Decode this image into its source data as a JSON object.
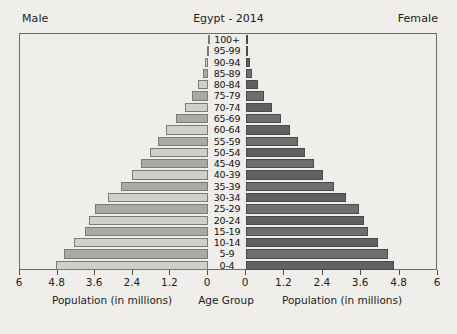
{
  "header": {
    "male_label": "Male",
    "female_label": "Female",
    "title": "Egypt - 2014"
  },
  "axis": {
    "left_title": "Population (in millions)",
    "center_title": "Age Group",
    "right_title": "Population (in millions)",
    "left_ticks": [
      "6",
      "4.8",
      "3.6",
      "2.4",
      "1.2",
      "0"
    ],
    "right_ticks": [
      "0",
      "1.2",
      "2.4",
      "3.6",
      "4.8",
      "6"
    ]
  },
  "chart_data": {
    "type": "bar",
    "subtype": "population-pyramid",
    "title": "Egypt - 2014",
    "xlabel": "Population (in millions)",
    "ylabel": "Age Group",
    "xlim": [
      0,
      6
    ],
    "xticks": [
      0,
      1.2,
      2.4,
      3.6,
      4.8,
      6
    ],
    "grid": false,
    "legend": [
      "Male",
      "Female"
    ],
    "legend_position": "top-corners",
    "categories": [
      "100+",
      "95-99",
      "90-94",
      "85-89",
      "80-84",
      "75-79",
      "70-74",
      "65-69",
      "60-64",
      "55-59",
      "50-54",
      "45-49",
      "40-39",
      "35-39",
      "30-34",
      "25-29",
      "20-24",
      "15-19",
      "10-14",
      "5-9",
      "0-4"
    ],
    "series": [
      {
        "name": "Male",
        "color": "#cfcfcb",
        "values": [
          0.01,
          0.04,
          0.09,
          0.17,
          0.33,
          0.5,
          0.73,
          1.02,
          1.33,
          1.6,
          1.84,
          2.13,
          2.43,
          2.79,
          3.19,
          3.62,
          3.8,
          3.93,
          4.27,
          4.6,
          4.84
        ]
      },
      {
        "name": "Female",
        "color": "#616161",
        "values": [
          0.01,
          0.05,
          0.11,
          0.2,
          0.37,
          0.56,
          0.8,
          1.08,
          1.36,
          1.62,
          1.85,
          2.12,
          2.4,
          2.74,
          3.12,
          3.52,
          3.7,
          3.82,
          4.11,
          4.44,
          4.63
        ]
      }
    ]
  },
  "style": {
    "background": "#efeeea",
    "frame": "#6b6b6b",
    "male_color": "#cfcfcb",
    "male_alt_color": "#a9a9a6",
    "female_color": "#616161",
    "female_alt_color": "#6f6f6f"
  }
}
